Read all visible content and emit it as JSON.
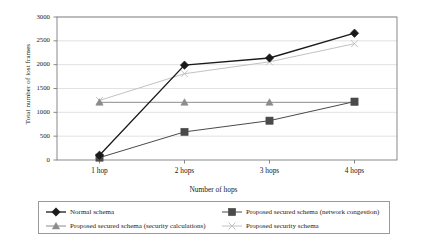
{
  "chart_data": {
    "type": "line",
    "title": "",
    "xlabel": "Number of hops",
    "ylabel": "Total number of lost frames",
    "categories": [
      "1 hop",
      "2 hops",
      "3 hops",
      "4 hops"
    ],
    "ylim": [
      0,
      3000
    ],
    "yticks": [
      0,
      500,
      1000,
      1500,
      2000,
      2500,
      3000
    ],
    "ytick_labels": [
      "0",
      "500",
      "1000",
      "1500",
      "2000",
      "2500",
      "3000"
    ],
    "grid": true,
    "grid_axis": "y",
    "legend_position": "bottom",
    "series": [
      {
        "name": "Normal schema",
        "values": [
          100,
          1990,
          2140,
          2660
        ],
        "color": "#1a1a1a",
        "marker": "diamond",
        "marker_size": 4.2,
        "line_width": 1.3
      },
      {
        "name": "Proposed secured schema (network congestion)",
        "values": [
          50,
          590,
          825,
          1225
        ],
        "color": "#4a4a4a",
        "marker": "square",
        "marker_size": 3.6,
        "line_width": 1.0
      },
      {
        "name": "Proposed secured schema (security calculations)",
        "values": [
          1210,
          1210,
          1210,
          1210
        ],
        "color": "#8c8c8c",
        "marker": "triangle",
        "marker_size": 3.6,
        "line_width": 1.0
      },
      {
        "name": "Proposed security schema",
        "values": [
          1250,
          1810,
          2060,
          2440
        ],
        "color": "#c2c2c2",
        "marker": "x",
        "marker_size": 3.4,
        "line_width": 1.0
      }
    ]
  },
  "axes": {
    "frame_color": "#7d7d7d",
    "grid_color": "#cfcfcf"
  },
  "legend": {
    "entries": [
      {
        "label": "Normal schema"
      },
      {
        "label": "Proposed secured schema (network congestion)"
      },
      {
        "label": "Proposed secured schema (security calculations)"
      },
      {
        "label": "Proposed security schema"
      }
    ]
  }
}
